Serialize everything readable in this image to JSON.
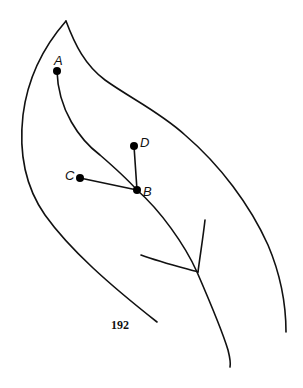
{
  "figure": {
    "nodes": [
      {
        "id": "A",
        "label": "A",
        "x": 57,
        "y": 71
      },
      {
        "id": "B",
        "label": "B",
        "x": 137,
        "y": 190
      },
      {
        "id": "C",
        "label": "C",
        "x": 80,
        "y": 178
      },
      {
        "id": "D",
        "label": "D",
        "x": 134,
        "y": 146
      }
    ],
    "edges": [
      {
        "from": "A",
        "to": "B"
      },
      {
        "from": "C",
        "to": "B"
      },
      {
        "from": "D",
        "to": "B"
      }
    ],
    "colors": {
      "ink": "#111111",
      "background": "#ffffff"
    }
  },
  "page_number": "192"
}
